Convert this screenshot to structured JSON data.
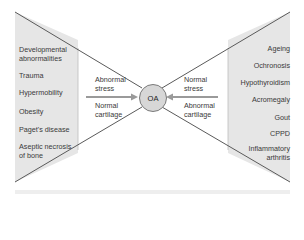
{
  "diagram": {
    "center": {
      "label": "OA"
    },
    "left_factors": [
      "Developmental abnormalities",
      "Trauma",
      "Hypermobility",
      "Obesity",
      "Paget's disease",
      "Aseptic necrosis of bone"
    ],
    "left_factors_display": [
      [
        "Developmental",
        "abnormalities"
      ],
      [
        "Trauma"
      ],
      [
        "Hypermobility"
      ],
      [
        "Obesity"
      ],
      [
        "Paget's disease"
      ],
      [
        "Aseptic necrosis",
        "of bone"
      ]
    ],
    "left_inner": {
      "top": [
        "Abnormal",
        "stress"
      ],
      "bottom": [
        "Normal",
        "cartilage"
      ]
    },
    "right_factors": [
      "Ageing",
      "Ochronosis",
      "Hypothyroidism",
      "Acromegaly",
      "Gout",
      "CPPD",
      "Inflammatory arthritis"
    ],
    "right_factors_display": [
      [
        "Ageing"
      ],
      [
        "Ochronosis"
      ],
      [
        "Hypothyroidism"
      ],
      [
        "Acromegaly"
      ],
      [
        "Gout"
      ],
      [
        "CPPD"
      ],
      [
        "Inflammatory",
        "arthritis"
      ]
    ],
    "right_inner": {
      "top": [
        "Normal",
        "stress"
      ],
      "bottom": [
        "Abnormal",
        "cartilage"
      ]
    },
    "colors": {
      "shade": "#e6e6e6",
      "line": "#5a5a5a",
      "arrow": "#9a9a9a",
      "circle_fill": "#d7d7d7",
      "footer_bar": "#eeeeee"
    }
  }
}
